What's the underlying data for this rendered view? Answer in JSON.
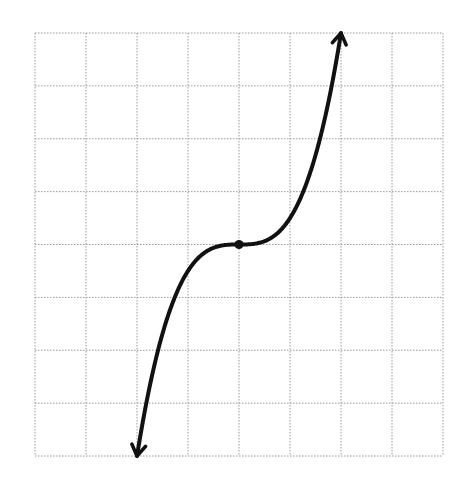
{
  "chart_data": {
    "type": "line",
    "title": "",
    "xlabel": "",
    "ylabel": "",
    "function": "y = 0.5 * x^3",
    "xlim": [
      -4,
      4
    ],
    "ylim": [
      -4,
      4
    ],
    "grid": true,
    "grid_style": "dotted",
    "grid_cells": {
      "columns": 8,
      "rows": 8
    },
    "tick_labels": false,
    "series": [
      {
        "name": "curve",
        "x": [
          -2,
          -1.5,
          -1,
          -0.5,
          0,
          0.5,
          1,
          1.5,
          2
        ],
        "y": [
          -4,
          -1.6875,
          -0.5,
          -0.0625,
          0,
          0.0625,
          0.5,
          1.6875,
          4
        ],
        "color": "#111111",
        "arrows": "both-ends"
      }
    ],
    "annotations": [
      {
        "type": "point",
        "x": 0,
        "y": 0,
        "label": "inflection point"
      }
    ]
  },
  "colors": {
    "curve": "#111111",
    "grid": "#9a9a9a",
    "background": "#ffffff"
  }
}
